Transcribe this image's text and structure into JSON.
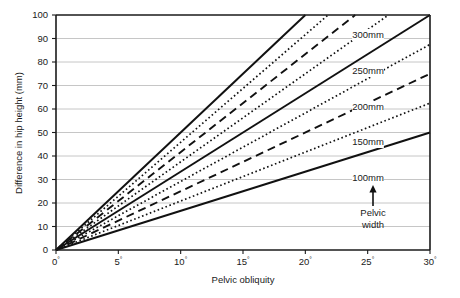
{
  "chart_data": {
    "type": "line",
    "title": "",
    "xlabel": "Pelvic obliquity",
    "ylabel": "Difference in hip height (mm)",
    "xlim": [
      0,
      30
    ],
    "ylim": [
      0,
      100
    ],
    "xticks": [
      "0",
      "5",
      "10",
      "15",
      "20",
      "25",
      "30"
    ],
    "xtick_suffix": "°",
    "yticks": [
      "0",
      "10",
      "20",
      "30",
      "40",
      "50",
      "60",
      "70",
      "80",
      "90",
      "100"
    ],
    "grid": "horizontal",
    "legend": "inline-right-labels",
    "annotation": {
      "text_line1": "Pelvic",
      "text_line2": "width",
      "arrow": "up-arrow",
      "points_to": "100mm"
    },
    "relationship": "difference = pelvic_width * sin(pelvic_obliquity)",
    "series": [
      {
        "name": "100mm",
        "pelvic_width_mm": 100,
        "style": "solid",
        "labeled": true,
        "x": [
          0,
          5,
          10,
          15,
          20,
          25,
          30
        ],
        "values": [
          0.0,
          8.7,
          17.4,
          25.9,
          34.2,
          42.3,
          50.0
        ]
      },
      {
        "name": "125mm",
        "pelvic_width_mm": 125,
        "style": "dotted",
        "labeled": false,
        "x": [
          0,
          5,
          10,
          15,
          20,
          25,
          30
        ],
        "values": [
          0.0,
          10.9,
          21.7,
          32.4,
          42.8,
          52.8,
          62.5
        ]
      },
      {
        "name": "150mm",
        "pelvic_width_mm": 150,
        "style": "dashed",
        "labeled": true,
        "x": [
          0,
          5,
          10,
          15,
          20,
          25,
          30
        ],
        "values": [
          0.0,
          13.1,
          26.0,
          38.8,
          51.3,
          63.4,
          75.0
        ]
      },
      {
        "name": "175mm",
        "pelvic_width_mm": 175,
        "style": "dotted",
        "labeled": false,
        "x": [
          0,
          5,
          10,
          15,
          20,
          25,
          30
        ],
        "values": [
          0.0,
          15.3,
          30.4,
          45.3,
          59.9,
          74.0,
          87.5
        ]
      },
      {
        "name": "200mm",
        "pelvic_width_mm": 200,
        "style": "solid",
        "labeled": true,
        "x": [
          0,
          5,
          10,
          15,
          20,
          25,
          30
        ],
        "values": [
          0.0,
          17.4,
          34.7,
          51.8,
          68.4,
          84.5,
          100.0
        ]
      },
      {
        "name": "225mm",
        "pelvic_width_mm": 225,
        "style": "dotted",
        "labeled": false,
        "x": [
          0,
          5,
          10,
          15,
          20,
          25,
          30
        ],
        "values": [
          0.0,
          19.6,
          39.1,
          58.2,
          77.0,
          95.1,
          112.5
        ]
      },
      {
        "name": "250mm",
        "pelvic_width_mm": 250,
        "style": "dashed",
        "labeled": true,
        "x": [
          0,
          5,
          10,
          15,
          20,
          25,
          30
        ],
        "values": [
          0.0,
          21.8,
          43.4,
          64.7,
          85.5,
          105.7,
          125.0
        ]
      },
      {
        "name": "275mm",
        "pelvic_width_mm": 275,
        "style": "dotted",
        "labeled": false,
        "x": [
          0,
          5,
          10,
          15,
          20,
          25,
          30
        ],
        "values": [
          0.0,
          24.0,
          47.8,
          71.2,
          94.1,
          116.2,
          137.5
        ]
      },
      {
        "name": "300mm",
        "pelvic_width_mm": 300,
        "style": "solid",
        "labeled": true,
        "x": [
          0,
          5,
          10,
          15,
          20,
          25,
          30
        ],
        "values": [
          0.0,
          26.1,
          52.1,
          77.6,
          102.6,
          126.8,
          150.0
        ]
      }
    ],
    "series_labels": [
      {
        "text": "300mm",
        "x_px": 368,
        "y_px": 38
      },
      {
        "text": "250mm",
        "x_px": 368,
        "y_px": 74
      },
      {
        "text": "200mm",
        "x_px": 368,
        "y_px": 110
      },
      {
        "text": "150mm",
        "x_px": 368,
        "y_px": 145
      },
      {
        "text": "100mm",
        "x_px": 368,
        "y_px": 181
      }
    ],
    "colors": {
      "line": "#111111",
      "grid": "#b8b8b8",
      "axis": "#1a1a1a",
      "background": "#ffffff"
    }
  }
}
